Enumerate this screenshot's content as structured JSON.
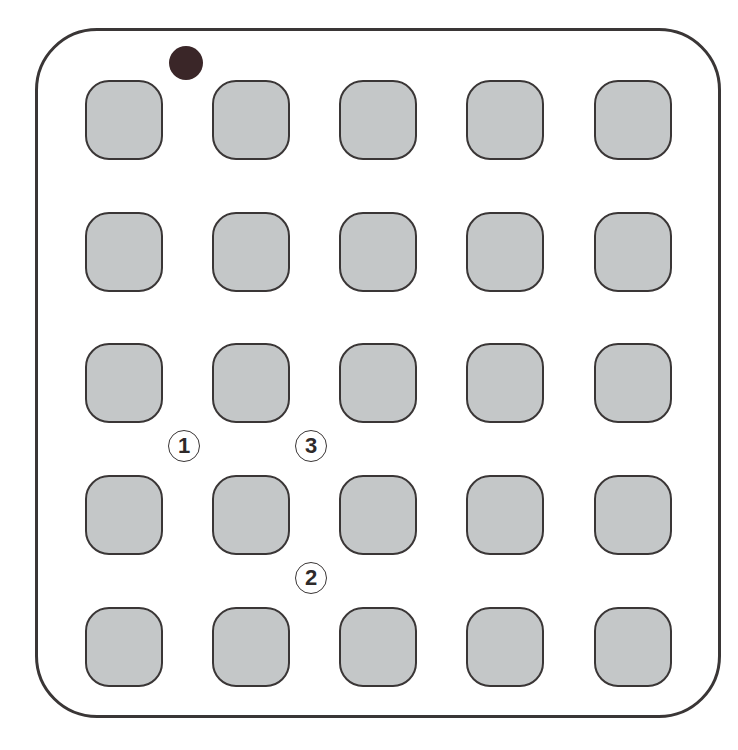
{
  "diagram": {
    "type": "pad-grid-layout",
    "grid": {
      "rows": 5,
      "cols": 5
    },
    "colors": {
      "outline": "#3a3636",
      "pad_fill": "#c4c7c8",
      "marker_dot": "#3a2628",
      "background": "#ffffff"
    },
    "pin1_marker": {
      "shape": "filled-circle",
      "position": "above column 1-2 gap, top row"
    },
    "labels": [
      {
        "id": "label-1",
        "text": "1",
        "position": "between row 3 and row 4, between column 1 and column 2"
      },
      {
        "id": "label-3",
        "text": "3",
        "position": "between row 3 and row 4, between column 2 and column 3"
      },
      {
        "id": "label-2",
        "text": "2",
        "position": "between row 4 and row 5, between column 2 and column 3"
      }
    ]
  }
}
